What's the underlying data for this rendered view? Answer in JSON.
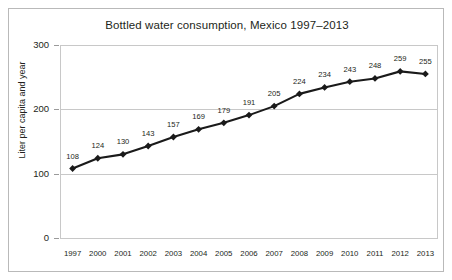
{
  "chart_data": {
    "type": "line",
    "title": "Bottled water consumption, Mexico 1997–2013",
    "xlabel": "",
    "ylabel": "Liter per capita and year",
    "categories": [
      "1997",
      "2000",
      "2001",
      "2002",
      "2003",
      "2004",
      "2005",
      "2006",
      "2007",
      "2008",
      "2009",
      "2010",
      "2011",
      "2012",
      "2013"
    ],
    "values": [
      108,
      124,
      130,
      143,
      157,
      169,
      179,
      191,
      205,
      224,
      234,
      243,
      248,
      259,
      255
    ],
    "ylim": [
      0,
      300
    ],
    "yticks": [
      0,
      100,
      200,
      300
    ],
    "ytick_labels": [
      "0",
      "100",
      "200",
      "300"
    ],
    "grid": true,
    "legend": "none",
    "show_data_labels": true,
    "marker": "diamond",
    "line_color": "#1a1a1a",
    "grid_color": "#c8c8c8",
    "background_color": "#ffffff",
    "border_color": "#b9b9b9"
  }
}
